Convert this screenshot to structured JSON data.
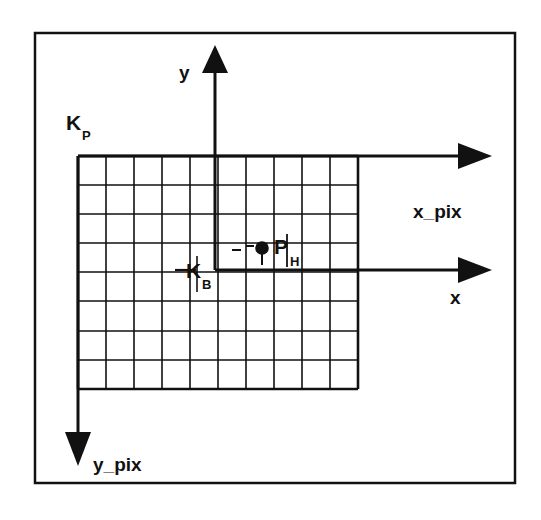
{
  "figure": {
    "background_color": "#ffffff",
    "line_color": "#111111",
    "border": {
      "name": "figure-frame",
      "x": 35,
      "y": 33,
      "width": 480,
      "height": 450,
      "stroke_width": 2.5
    }
  },
  "labels": {
    "k_p": {
      "base": "K",
      "subscript": "P",
      "meaning": "pixel coordinate system origin",
      "x": 66,
      "y": 130
    },
    "k_b": {
      "base": "K",
      "subscript": "B",
      "meaning": "image/sensor coordinate system origin",
      "x": 186,
      "y": 277
    },
    "p_h": {
      "base": "P",
      "subscript": "H",
      "meaning": "principal point / image point",
      "x": 274,
      "y": 253
    },
    "x_pix": {
      "text": "x_pix",
      "meaning": "horizontal pixel axis",
      "x": 413,
      "y": 218
    },
    "y_pix": {
      "text": "y_pix",
      "meaning": "vertical pixel axis",
      "x": 93,
      "y": 470
    },
    "x_axis": {
      "text": "x",
      "meaning": "horizontal sensor axis",
      "x": 451,
      "y": 303
    },
    "y_axis": {
      "text": "y",
      "meaning": "vertical sensor axis",
      "x": 182,
      "y": 78
    }
  },
  "grid": {
    "name": "pixel-grid",
    "left": 78,
    "top": 156,
    "right": 358,
    "bottom": 389,
    "columns": 10,
    "rows": 8,
    "cell_width": 28,
    "cell_height": 29.125,
    "stroke_width": 1.6,
    "outline_stroke_width": 2.6
  },
  "axes": {
    "x_pix_axis": {
      "name": "x-pix-axis",
      "from_x": 78,
      "from_y": 156,
      "to_x": 470,
      "to_y": 156,
      "direction": "right",
      "stroke_width": 3
    },
    "y_pix_axis": {
      "name": "y-pix-axis",
      "from_x": 78,
      "from_y": 156,
      "to_x": 78,
      "to_y": 455,
      "direction": "down",
      "stroke_width": 3
    },
    "x_axis": {
      "name": "x-axis",
      "from_x": 215,
      "from_y": 270,
      "to_x": 470,
      "to_y": 270,
      "direction": "right",
      "stroke_width": 3
    },
    "y_axis": {
      "name": "y-axis",
      "from_x": 215,
      "from_y": 270,
      "to_x": 215,
      "to_y": 55,
      "direction": "up",
      "stroke_width": 3
    }
  },
  "point": {
    "name": "point-p-h",
    "cx": 262,
    "cy": 249,
    "radius": 6.5,
    "stem_to_y": 264,
    "fill": "#111111"
  },
  "ticks": {
    "k_b_horizontal": {
      "x1": 178,
      "y1": 270,
      "x2": 196,
      "y2": 270
    },
    "k_b_vertical": {
      "x1": 197,
      "y1": 258,
      "x2": 197,
      "y2": 290
    },
    "p_h_vertical": {
      "x1": 287,
      "y1": 236,
      "x2": 287,
      "y2": 266
    },
    "p_h_dash_left": {
      "x1": 233,
      "y1": 249,
      "x2": 242,
      "y2": 249
    },
    "p_h_dash_right": {
      "x1": 247,
      "y1": 247,
      "x2": 254,
      "y2": 247
    }
  }
}
